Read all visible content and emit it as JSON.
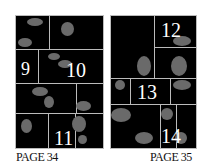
{
  "pages": [
    {
      "label": "PAGE 34",
      "panels": [
        "9",
        "10",
        "11"
      ]
    },
    {
      "label": "PAGE 35",
      "panels": [
        "12",
        "13",
        "14"
      ]
    }
  ]
}
